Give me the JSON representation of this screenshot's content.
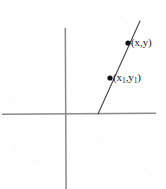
{
  "figure": {
    "background_color": "#fefefe",
    "axis_color": "#8a8a8a",
    "line_color": "#4a4a4a",
    "point_color": "#111111",
    "label_color": "#1a1a1a"
  },
  "axes": {
    "x_axis": {
      "name": "horizontal-axis",
      "x1": 2,
      "y1": 114,
      "x2": 156,
      "y2": 113
    },
    "y_axis": {
      "name": "vertical-axis",
      "x1": 65,
      "y1": 28,
      "x2": 66,
      "y2": 189
    },
    "origin": {
      "x": 65,
      "y": 114
    }
  },
  "line": {
    "name": "sloped-line",
    "x1": 98,
    "y1": 114,
    "x2": 140,
    "y2": 21
  },
  "points": [
    {
      "id": "point-xy",
      "label": "(x,y)",
      "label_base": "(x,y)",
      "cx": 128,
      "cy": 43,
      "r": 2.6
    },
    {
      "id": "point-x1y1",
      "label": "(x1,y1)",
      "cx": 110,
      "cy": 78,
      "r": 2.6
    }
  ],
  "labels": {
    "upper_point": {
      "open_paren": "(",
      "var_x": "x",
      "comma": ",",
      "var_y": "y",
      "close_paren": ")"
    },
    "lower_point": {
      "open_paren": "(",
      "var_x": "x",
      "sub_x": "1",
      "comma": ",",
      "var_y": "y",
      "sub_y": "1",
      "close_paren": ")"
    }
  }
}
